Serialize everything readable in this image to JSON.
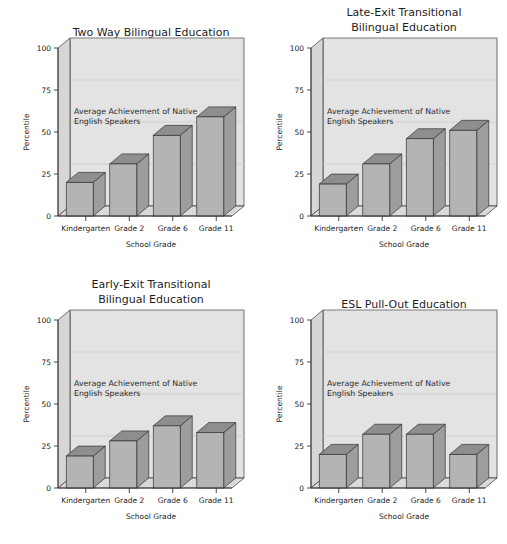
{
  "figure": {
    "panel_count": 4,
    "shared": {
      "xlabel": "School Grade",
      "ylabel": "Percentile",
      "categories": [
        "Kindergarten",
        "Grade 2",
        "Grade 6",
        "Grade 11"
      ],
      "yticks": [
        "0",
        "25",
        "50",
        "75",
        "100"
      ],
      "annotation_line1": "Average Achievement of Native",
      "annotation_line2": "English Speakers",
      "colors": {
        "plot_background": "#e3e3e3",
        "bar_front": "#b4b4b4",
        "bar_top": "#8e8e8e",
        "bar_side": "#9d9d9d",
        "outline": "#333333",
        "gridline": "#c8c8c8",
        "text": "#1d1d1d",
        "page_background": "#ffffff"
      }
    }
  },
  "chart_data": [
    {
      "type": "bar",
      "id": "two-way-bilingual-education",
      "title": "Two Way Bilingual Education",
      "title_lines": [
        "Two Way Bilingual Education"
      ],
      "xlabel": "School Grade",
      "ylabel": "Percentile",
      "categories": [
        "Kindergarten",
        "Grade 2",
        "Grade 6",
        "Grade 11"
      ],
      "values": [
        20,
        31,
        48,
        59
      ],
      "ylim": [
        0,
        100
      ],
      "yticks": [
        0,
        25,
        50,
        75,
        100
      ],
      "grid": true,
      "annotation": "Average Achievement of Native English Speakers",
      "annotation_level": 50,
      "legend": "none"
    },
    {
      "type": "bar",
      "id": "late-exit-transitional-bilingual-education",
      "title": "Late-Exit Transitional Bilingual Education",
      "title_lines": [
        "Late-Exit Transitional",
        "Bilingual Education"
      ],
      "xlabel": "School Grade",
      "ylabel": "Percentile",
      "categories": [
        "Kindergarten",
        "Grade 2",
        "Grade 6",
        "Grade 11"
      ],
      "values": [
        19,
        31,
        46,
        51
      ],
      "ylim": [
        0,
        100
      ],
      "yticks": [
        0,
        25,
        50,
        75,
        100
      ],
      "grid": true,
      "annotation": "Average Achievement of Native English Speakers",
      "annotation_level": 50,
      "legend": "none"
    },
    {
      "type": "bar",
      "id": "early-exit-transitional-bilingual-education",
      "title": "Early-Exit Transitional Bilingual Education",
      "title_lines": [
        "Early-Exit Transitional",
        "Bilingual Education"
      ],
      "xlabel": "School Grade",
      "ylabel": "Percentile",
      "categories": [
        "Kindergarten",
        "Grade 2",
        "Grade 6",
        "Grade 11"
      ],
      "values": [
        19,
        28,
        37,
        33
      ],
      "ylim": [
        0,
        100
      ],
      "yticks": [
        0,
        25,
        50,
        75,
        100
      ],
      "grid": true,
      "annotation": "Average Achievement of Native English Speakers",
      "annotation_level": 50,
      "legend": "none"
    },
    {
      "type": "bar",
      "id": "esl-pull-out-education",
      "title": "ESL Pull-Out Education",
      "title_lines": [
        "ESL Pull-Out Education"
      ],
      "xlabel": "School Grade",
      "ylabel": "Percentile",
      "categories": [
        "Kindergarten",
        "Grade 2",
        "Grade 6",
        "Grade 11"
      ],
      "values": [
        20,
        32,
        32,
        20
      ],
      "ylim": [
        0,
        100
      ],
      "yticks": [
        0,
        25,
        50,
        75,
        100
      ],
      "grid": true,
      "annotation": "Average Achievement of Native English Speakers",
      "annotation_level": 50,
      "legend": "none"
    }
  ]
}
